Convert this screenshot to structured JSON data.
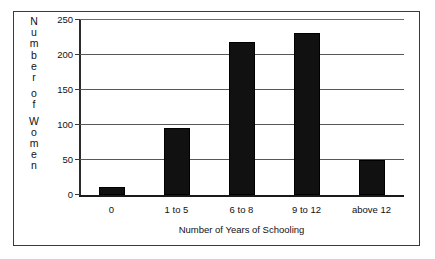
{
  "figure": {
    "background_color": "#ffffff",
    "frame_color": "#3a3a3a",
    "bar_color": "#111111",
    "grid_color": "#585858"
  },
  "y_axis_title_letters": [
    "N",
    "u",
    "m",
    "b",
    "e",
    "r",
    "",
    "o",
    "f",
    "",
    "W",
    "o",
    "m",
    "e",
    "n"
  ],
  "chart_data": {
    "type": "bar",
    "title": "",
    "xlabel": "Number of Years of Schooling",
    "ylabel": "Number of Women",
    "categories": [
      "0",
      "1 to 5",
      "6 to 8",
      "9 to 12",
      "above 12"
    ],
    "values": [
      12,
      96,
      218,
      232,
      50
    ],
    "ylim": [
      0,
      250
    ],
    "yticks": [
      0,
      50,
      100,
      150,
      200,
      250
    ],
    "ytick_labels": [
      "0",
      "50",
      "100",
      "150",
      "200",
      "250"
    ],
    "grid": true,
    "grid_axis": "y",
    "legend": false,
    "legend_position": "none",
    "bar_color": "#111111",
    "series": [
      {
        "name": "Number of Women",
        "values": [
          12,
          96,
          218,
          232,
          50
        ]
      }
    ]
  }
}
